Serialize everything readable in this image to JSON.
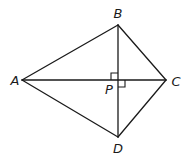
{
  "diagram": {
    "type": "quadrilateral-kite",
    "points": {
      "A": {
        "label": "A",
        "x": 22,
        "y": 80,
        "lx": 15,
        "ly": 85
      },
      "B": {
        "label": "B",
        "x": 118,
        "y": 25,
        "lx": 118,
        "ly": 18
      },
      "C": {
        "label": "C",
        "x": 166,
        "y": 80,
        "lx": 176,
        "ly": 86
      },
      "D": {
        "label": "D",
        "x": 118,
        "y": 137,
        "lx": 118,
        "ly": 153
      },
      "P": {
        "label": "P",
        "x": 118,
        "y": 80,
        "lx": 109,
        "ly": 94
      }
    },
    "segments": [
      {
        "name": "AB",
        "from": "A",
        "to": "B"
      },
      {
        "name": "BC",
        "from": "B",
        "to": "C"
      },
      {
        "name": "CD",
        "from": "C",
        "to": "D"
      },
      {
        "name": "DA",
        "from": "D",
        "to": "A"
      },
      {
        "name": "AC",
        "from": "A",
        "to": "C"
      },
      {
        "name": "BD",
        "from": "B",
        "to": "D"
      }
    ],
    "right_angle_marks": [
      {
        "at": "P",
        "quadrant": "upper-left",
        "size": 7
      },
      {
        "at": "P",
        "quadrant": "lower-right",
        "size": 7
      }
    ],
    "stroke_color": "#1a1a1a",
    "background": "#ffffff"
  }
}
